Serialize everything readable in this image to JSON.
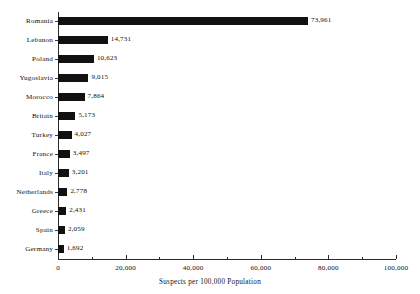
{
  "chart_data": {
    "type": "bar",
    "orientation": "horizontal",
    "title": "",
    "subtitle": "",
    "xlabel": "Suspects per 100,000 Population",
    "ylabel": "",
    "xlim": [
      0,
      100000
    ],
    "grid": false,
    "legend": false,
    "x_major_ticks": [
      0,
      20000,
      40000,
      60000,
      80000,
      100000
    ],
    "x_tick_labels": [
      "0",
      "20,000",
      "40,000",
      "60,000",
      "80,000",
      "100,000"
    ],
    "x_minor_ticks": [
      10000,
      30000,
      50000,
      70000,
      90000
    ],
    "categories": [
      "Romania",
      "Lebanon",
      "Poland",
      "Yugoslavia",
      "Morocco",
      "Britain",
      "Turkey",
      "France",
      "Italy",
      "Netherlands",
      "Greece",
      "Spain",
      "Germany"
    ],
    "values": [
      73961,
      14731,
      10623,
      9015,
      7864,
      5173,
      4027,
      3497,
      3201,
      2778,
      2431,
      2059,
      1692
    ],
    "value_labels": [
      "73,961",
      "14,731",
      "10,623",
      "9,015",
      "7,864",
      "5,173",
      "4,027",
      "3,497",
      "3,201",
      "2,778",
      "2,431",
      "2,059",
      "1,692"
    ],
    "bar_color": "#111111",
    "axis_color": "#2a2a2a",
    "background_color": "#ffffff"
  }
}
